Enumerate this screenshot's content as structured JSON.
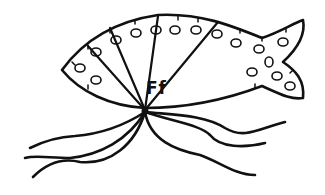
{
  "illustration": {
    "subject": "fish",
    "letter_label": "Ff",
    "line_color": "#111111",
    "background_color": "#ffffff"
  }
}
